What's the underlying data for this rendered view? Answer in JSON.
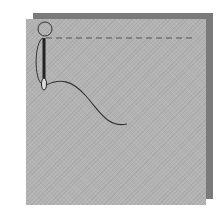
{
  "illustration": {
    "subject": "Sewing two fabric layers with needle and thread",
    "elements": [
      "back-fabric-layer",
      "front-fabric-layer",
      "needle",
      "thread",
      "dashed-stitch-line"
    ],
    "colors": {
      "back_fabric": "#7a7a7a",
      "front_fabric": "#b3b3b3",
      "needle": "#222222",
      "thread": "#333333",
      "stitch_line": "#555555"
    }
  }
}
